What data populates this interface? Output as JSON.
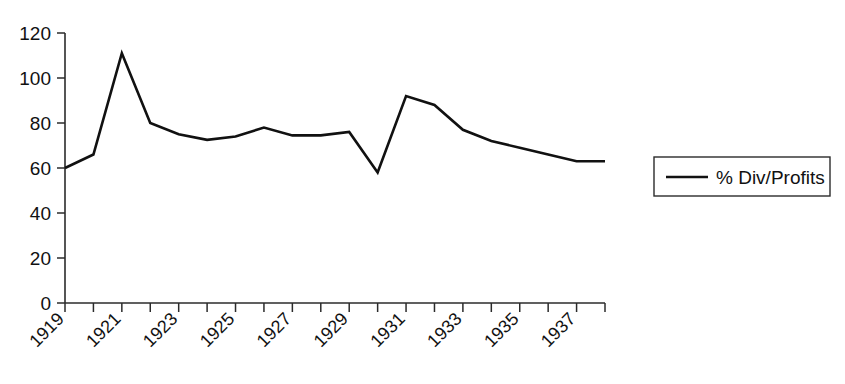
{
  "chart_data": {
    "type": "line",
    "title": "",
    "xlabel": "",
    "ylabel": "",
    "xlim": [
      1919,
      1938
    ],
    "ylim": [
      0,
      120
    ],
    "grid": false,
    "legend_position": "right",
    "y_ticks": [
      0,
      20,
      40,
      60,
      80,
      100,
      120
    ],
    "y_tick_labels": [
      "0",
      "20",
      "40",
      "60",
      "80",
      "100",
      "120"
    ],
    "x_tick_labels": [
      "1919",
      "1921",
      "1923",
      "1925",
      "1927",
      "1929",
      "1931",
      "1933",
      "1935",
      "1937"
    ],
    "x_tick_label_years": [
      1919,
      1921,
      1923,
      1925,
      1927,
      1929,
      1931,
      1933,
      1935,
      1937
    ],
    "x_minor_ticks_every": 1,
    "x": [
      1919,
      1920,
      1921,
      1922,
      1923,
      1924,
      1925,
      1926,
      1927,
      1928,
      1929,
      1930,
      1931,
      1932,
      1933,
      1934,
      1935,
      1936,
      1937,
      1938
    ],
    "series": [
      {
        "name": "% Div/Profits",
        "color": "#111111",
        "values": [
          60,
          66,
          111,
          80,
          75,
          72.5,
          74,
          78,
          74.5,
          74.5,
          76,
          58,
          92,
          88,
          77,
          72,
          69,
          66,
          63,
          63
        ]
      }
    ],
    "annotations": []
  },
  "legend": {
    "entries": [
      {
        "label": "% Div/Profits",
        "color": "#111111"
      }
    ]
  },
  "axes": {
    "y_axis_name": "value-axis",
    "x_axis_name": "year-axis"
  }
}
